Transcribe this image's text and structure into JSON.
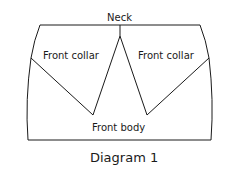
{
  "diagram": {
    "labels": {
      "neck": "Neck",
      "left_collar": "Front collar",
      "right_collar": "Front collar",
      "body": "Front body"
    },
    "caption": "Diagram 1",
    "stroke_color": "#1a1a1a"
  }
}
